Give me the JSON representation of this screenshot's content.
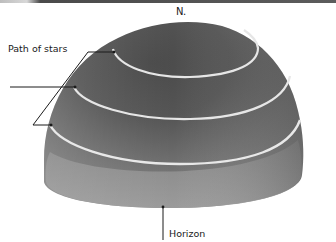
{
  "diagram": {
    "labels": {
      "north": "N.",
      "path_of_stars": "Path of stars",
      "horizon": "Horizon"
    },
    "elements": [
      {
        "type": "dome",
        "description": "Gray shaded 3D hemisphere (sky dome)"
      },
      {
        "type": "arc",
        "name": "star-path-upper",
        "description": "White arc near the top of the dome"
      },
      {
        "type": "arc",
        "name": "star-path-middle",
        "description": "White arc across the middle of the dome"
      },
      {
        "type": "arc",
        "name": "star-path-lower",
        "description": "White arc near the base of the dome"
      },
      {
        "type": "leader-line",
        "from": "Path of stars",
        "to": [
          "star-path-upper",
          "star-path-middle",
          "star-path-lower"
        ]
      },
      {
        "type": "pointer",
        "from": "Horizon",
        "to": "dome base edge"
      }
    ],
    "colors": {
      "dome_dark": "#3e3e3e",
      "dome_mid": "#6a6a6a",
      "dome_light": "#9a9a9a",
      "star_path": "#e6e6e6",
      "ink": "#1a1a1a",
      "top_strip": "#5a5a5a",
      "background": "#ffffff"
    }
  }
}
